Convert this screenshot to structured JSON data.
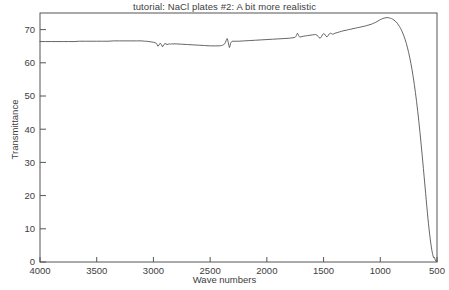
{
  "chart_data": {
    "type": "line",
    "title": "tutorial: NaCl plates #2:  A bit more realistic",
    "xlabel": "Wave numbers",
    "ylabel": "Transmittance",
    "xlim": [
      4000,
      500
    ],
    "ylim": [
      0,
      75
    ],
    "x_reversed": true,
    "grid": false,
    "legend": null,
    "xticks": [
      4000,
      3500,
      3000,
      2500,
      2000,
      1500,
      1000,
      500
    ],
    "xtick_labels": [
      "4000",
      "3500",
      "3000",
      "2500",
      "2000",
      "1500",
      "1000",
      "500"
    ],
    "yticks": [
      0,
      10,
      20,
      30,
      40,
      50,
      60,
      70
    ],
    "ytick_labels": [
      "0",
      "10",
      "20",
      "30",
      "40",
      "50",
      "60",
      "70"
    ],
    "line_color": "#555555",
    "series": [
      {
        "name": "NaCl plate transmittance",
        "x": [
          4000,
          3950,
          3900,
          3850,
          3800,
          3750,
          3700,
          3650,
          3600,
          3550,
          3500,
          3450,
          3400,
          3350,
          3300,
          3250,
          3200,
          3150,
          3100,
          3080,
          3060,
          3040,
          3020,
          3000,
          2980,
          2970,
          2960,
          2950,
          2940,
          2930,
          2920,
          2910,
          2900,
          2890,
          2880,
          2870,
          2860,
          2850,
          2840,
          2820,
          2800,
          2750,
          2700,
          2650,
          2600,
          2550,
          2500,
          2450,
          2420,
          2400,
          2390,
          2380,
          2370,
          2365,
          2360,
          2355,
          2350,
          2345,
          2340,
          2335,
          2330,
          2325,
          2320,
          2315,
          2310,
          2300,
          2280,
          2250,
          2200,
          2150,
          2100,
          2050,
          2000,
          1950,
          1900,
          1850,
          1800,
          1780,
          1760,
          1750,
          1745,
          1740,
          1735,
          1730,
          1725,
          1720,
          1715,
          1710,
          1700,
          1690,
          1680,
          1660,
          1640,
          1620,
          1600,
          1580,
          1570,
          1560,
          1550,
          1540,
          1530,
          1520,
          1510,
          1500,
          1490,
          1480,
          1470,
          1460,
          1450,
          1440,
          1430,
          1420,
          1410,
          1400,
          1380,
          1360,
          1340,
          1320,
          1300,
          1280,
          1260,
          1240,
          1220,
          1200,
          1180,
          1160,
          1140,
          1120,
          1100,
          1080,
          1060,
          1040,
          1020,
          1000,
          980,
          960,
          950,
          940,
          930,
          920,
          910,
          900,
          890,
          880,
          870,
          860,
          850,
          840,
          830,
          820,
          810,
          800,
          790,
          780,
          770,
          760,
          750,
          740,
          730,
          720,
          710,
          700,
          690,
          680,
          670,
          660,
          650,
          640,
          630,
          620,
          610,
          600,
          595,
          590,
          585,
          580,
          575,
          570,
          565,
          560,
          555,
          550,
          545,
          540,
          535,
          530,
          525,
          520,
          515,
          510,
          505,
          500
        ],
        "y": [
          66.4,
          66.4,
          66.4,
          66.4,
          66.4,
          66.4,
          66.4,
          66.5,
          66.5,
          66.5,
          66.5,
          66.5,
          66.5,
          66.6,
          66.6,
          66.6,
          66.6,
          66.6,
          66.6,
          66.5,
          66.5,
          66.4,
          66.3,
          66.2,
          66.0,
          65.6,
          65.0,
          65.4,
          65.9,
          65.5,
          64.8,
          65.3,
          65.8,
          65.7,
          65.5,
          65.6,
          65.7,
          65.6,
          65.7,
          65.7,
          65.7,
          65.6,
          65.5,
          65.4,
          65.3,
          65.2,
          65.1,
          65.1,
          65.1,
          65.2,
          65.3,
          65.5,
          65.8,
          66.2,
          66.6,
          67.0,
          67.3,
          66.8,
          66.0,
          65.2,
          64.6,
          65.1,
          65.8,
          66.2,
          66.4,
          66.5,
          66.5,
          66.5,
          66.6,
          66.7,
          66.8,
          66.9,
          67.0,
          67.1,
          67.2,
          67.3,
          67.4,
          67.5,
          67.6,
          67.7,
          67.9,
          68.2,
          68.6,
          68.9,
          68.6,
          68.2,
          67.9,
          67.8,
          67.8,
          67.9,
          68.0,
          68.1,
          68.2,
          68.3,
          68.4,
          68.5,
          68.5,
          68.4,
          68.0,
          67.6,
          67.4,
          67.8,
          68.4,
          68.8,
          68.6,
          68.1,
          67.8,
          68.2,
          68.7,
          68.9,
          68.8,
          68.6,
          68.7,
          68.9,
          69.1,
          69.3,
          69.5,
          69.7,
          69.8,
          70.0,
          70.1,
          70.3,
          70.4,
          70.6,
          70.7,
          70.9,
          71.0,
          71.2,
          71.4,
          71.6,
          71.9,
          72.2,
          72.6,
          73.0,
          73.3,
          73.5,
          73.6,
          73.6,
          73.6,
          73.5,
          73.4,
          73.3,
          73.1,
          72.9,
          72.6,
          72.3,
          71.9,
          71.4,
          70.9,
          70.3,
          69.6,
          68.8,
          67.9,
          66.9,
          65.8,
          64.5,
          63.1,
          61.5,
          59.8,
          57.9,
          55.8,
          53.5,
          51.0,
          48.3,
          45.4,
          42.3,
          39.0,
          35.5,
          31.9,
          28.2,
          24.4,
          20.6,
          18.7,
          16.8,
          15.0,
          13.2,
          11.5,
          9.9,
          8.4,
          7.0,
          5.7,
          4.5,
          3.5,
          2.6,
          1.9,
          1.3,
          1.5,
          1.1,
          0.6,
          0.3,
          0.2,
          0.2
        ]
      }
    ]
  }
}
